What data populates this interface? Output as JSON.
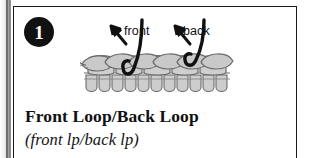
{
  "figure": {
    "step_number": "1",
    "title": "Front Loop/Back Loop",
    "abbreviation": "(front lp/back lp)",
    "labels": {
      "front": "front",
      "back": "back"
    },
    "colors": {
      "ink": "#111111",
      "frame": "#1a1a1a",
      "stitch_fill": "#c9c9c9",
      "stitch_fill_light": "#d8d8d8",
      "stitch_outline": "#6b6b6b",
      "hook_line": "#111111",
      "badge_bg": "#111111",
      "badge_text": "#ffffff",
      "page": "#ffffff"
    }
  }
}
